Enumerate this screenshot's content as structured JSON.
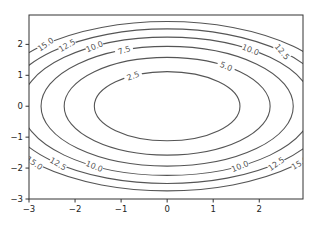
{
  "chart_data": {
    "type": "contour",
    "title": "",
    "xlabel": "",
    "ylabel": "",
    "function_hint": "f(x, y) = x^2 + 2*y^2",
    "xlim": [
      -3,
      2.95
    ],
    "ylim": [
      -3,
      2.95
    ],
    "xticks": [
      -3,
      -2,
      -1,
      0,
      1,
      2
    ],
    "yticks": [
      -3,
      -2,
      -1,
      0,
      1,
      2
    ],
    "xtick_labels": [
      "−3",
      "−2",
      "−1",
      "0",
      "1",
      "2"
    ],
    "ytick_labels": [
      "−3",
      "−2",
      "−1",
      "0",
      "1",
      "2"
    ],
    "levels": [
      2.5,
      5.0,
      7.5,
      10.0,
      12.5,
      15.0
    ],
    "level_labels": [
      "2.5",
      "5.0",
      "7.5",
      "10.0",
      "12.5",
      "15.0"
    ],
    "line_color": "#555555",
    "grid": false,
    "legend": null
  }
}
